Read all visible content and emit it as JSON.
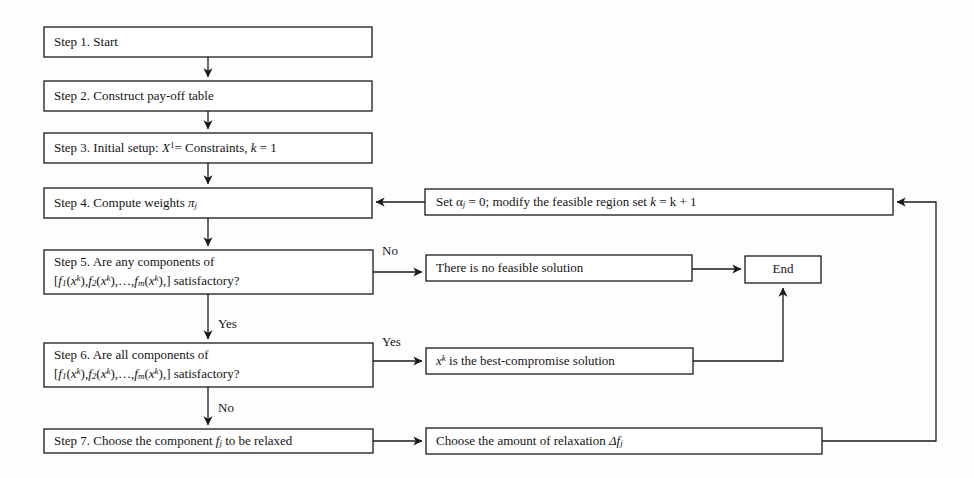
{
  "diagram": {
    "background_color": "#fdfdfd",
    "line_color": "#1a1a1a",
    "box_fill": "#ffffff",
    "nodes": {
      "step1": {
        "label": "Step 1. Start"
      },
      "step2": {
        "label": "Step 2. Construct pay-off table"
      },
      "step3": {
        "label": "Step 3. Initial setup: X¹= Constraints, k = 1",
        "parts": {
          "prefix": "Step 3. Initial setup: ",
          "var": "X",
          "sup": "1",
          "mid": "= Constraints, ",
          "k": "k",
          "tail": " = 1"
        }
      },
      "step4": {
        "label": "Step 4. Compute weights πⱼ",
        "parts": {
          "prefix": "Step 4. Compute weights ",
          "symbol": "π",
          "sub": "j"
        }
      },
      "step5": {
        "line1": "Step 5. Are any components of",
        "line2": "[f₁(xᵏ), f₂ (xᵏ), … , fₘ (xᵏ),] satisfactory?"
      },
      "step6": {
        "line1": "Step 6. Are all components of",
        "line2": "[f₁(xᵏ), f₂ (xᵏ), … , fₘ (xᵏ),] satisfactory?"
      },
      "step7": {
        "label": "Step 7. Choose the component fⱼ to be relaxed",
        "parts": {
          "prefix": "Step 7. Choose the component ",
          "f": "f",
          "sub": "j",
          "tail": " to be relaxed"
        }
      },
      "modify": {
        "label": "Set αⱼ = 0; modify the feasible region set k = k + 1",
        "parts": {
          "prefix": "Set ",
          "alpha": "α",
          "sub": "j",
          "mid": " = 0; modify the feasible region set ",
          "k": "k",
          "tail": " = k + 1"
        }
      },
      "nofeasible": {
        "label": "There is no feasible solution"
      },
      "end": {
        "label": "End"
      },
      "bestcompromise": {
        "label": "xᵏ is the best-compromise solution",
        "parts": {
          "x": "x",
          "sup": "k",
          "tail": " is the best-compromise solution"
        }
      },
      "relaxation": {
        "label": "Choose the amount of relaxation Δfⱼ",
        "parts": {
          "prefix": "Choose the amount of relaxation  ",
          "delta": "Δf",
          "sub": "j"
        }
      }
    },
    "edge_labels": {
      "step5_no": "No",
      "step5_yes": "Yes",
      "step6_yes": "Yes",
      "step6_no": "No"
    },
    "math_fragments": {
      "bracket_open": "[",
      "f": "f",
      "sub1": "1",
      "sub2": "2",
      "subm": "m",
      "subj": "j",
      "x": "x",
      "supk": "k",
      "paren_open": "(",
      "paren_close": ")",
      "comma": ",",
      "ellipsis": "…",
      "bracket_close": ",] satisfactory?"
    }
  }
}
